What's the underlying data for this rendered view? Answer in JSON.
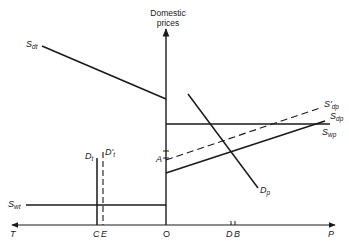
{
  "diagram": {
    "y_axis_label_line1": "Domestic",
    "y_axis_label_line2": "prices",
    "x_axis": {
      "left_end": "T",
      "right_end": "P",
      "origin": "O",
      "points": [
        "C",
        "E",
        "D",
        "B"
      ]
    },
    "y_axis_points": [
      "A"
    ],
    "curves": {
      "S_dt": {
        "main": "S",
        "sub": "dt"
      },
      "S_wt": {
        "main": "S",
        "sub": "wt"
      },
      "D_t": {
        "main": "D",
        "sub": "t"
      },
      "D_t_prime": {
        "main": "D'",
        "sub": "t"
      },
      "D_p": {
        "main": "D",
        "sub": "p"
      },
      "S_dp_prime": {
        "main": "S'",
        "sub": "dp"
      },
      "S_dp": {
        "main": "S",
        "sub": "dp"
      },
      "S_wp": {
        "main": "S",
        "sub": "wp"
      }
    },
    "colors": {
      "ink": "#1a1a1a",
      "background": "#ffffff"
    }
  }
}
